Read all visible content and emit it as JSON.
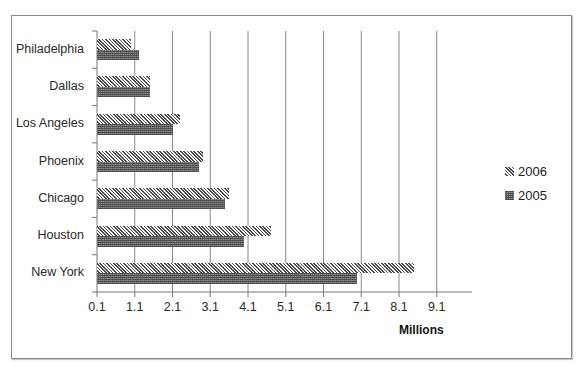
{
  "chart_data": {
    "type": "bar",
    "orientation": "horizontal",
    "title": "",
    "xlabel": "Millions",
    "ylabel": "",
    "categories": [
      "New York",
      "Houston",
      "Chicago",
      "Phoenix",
      "Los Angeles",
      "Dallas",
      "Philadelphia"
    ],
    "series": [
      {
        "name": "2006",
        "pattern": "diagonal-hatch",
        "values": [
          8.5,
          4.7,
          3.6,
          2.9,
          2.3,
          1.5,
          1.0
        ]
      },
      {
        "name": "2005",
        "pattern": "dark-crosshatch",
        "values": [
          7.0,
          4.0,
          3.5,
          2.8,
          2.1,
          1.5,
          1.2
        ]
      }
    ],
    "xlim": [
      0.1,
      10.1
    ],
    "xticks": [
      "0.1",
      "1.1",
      "2.1",
      "3.1",
      "4.1",
      "5.1",
      "6.1",
      "7.1",
      "8.1",
      "9.1"
    ],
    "grid": {
      "vertical": true,
      "horizontal": false
    },
    "legend_position": "right",
    "colors": {
      "series_2006": "#4a4a4a",
      "series_2005": "#6e6e6e",
      "grid": "#888888",
      "border": "#8a8a8a"
    }
  },
  "legend": [
    {
      "label": "2006"
    },
    {
      "label": "2005"
    }
  ],
  "axis": {
    "x_title": "Millions"
  }
}
